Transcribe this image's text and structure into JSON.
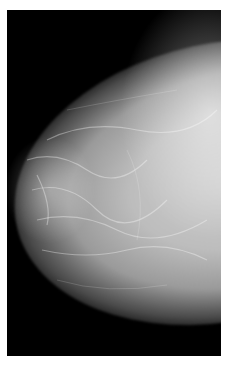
{
  "image": {
    "description": "Grayscale mammogram (craniocaudal-style view) of breast tissue on a black background, with a thin white border",
    "colors": {
      "border": "#ffffff",
      "background": "#000000",
      "tissue_core": "#c8c8c8",
      "tissue_edge": "#4a4a4a"
    }
  }
}
